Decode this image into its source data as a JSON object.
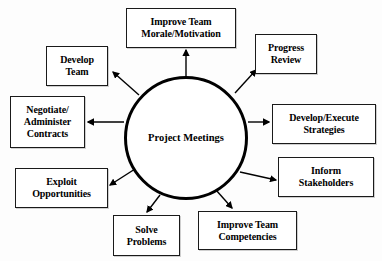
{
  "diagram": {
    "title": "Project Meetings",
    "type": "hub-and-spoke",
    "hub": {
      "label": "Project Meetings",
      "line1": "Project",
      "line2": "Meetings",
      "center_x": 186,
      "center_y": 138,
      "radius": 62,
      "border_color": "#000000",
      "fill_color": "#ffffff"
    },
    "colors": {
      "background": "#fdfdfd",
      "box_border": "#1a1a1a",
      "box_fill": "#ffffff",
      "text": "#000000",
      "arrow": "#000000"
    },
    "nodes": [
      {
        "id": "improve-team-morale-motivation",
        "label": "Improve Team Morale/Motivation",
        "line1": "Improve Team",
        "line2": "Morale/Motivation",
        "x": 126,
        "y": 8,
        "w": 110,
        "h": 40,
        "arrow_direction": "up"
      },
      {
        "id": "progress-review",
        "label": "Progress Review",
        "line1": "Progress",
        "line2": "Review",
        "x": 255,
        "y": 34,
        "w": 62,
        "h": 40,
        "arrow_direction": "up-right"
      },
      {
        "id": "develop-team",
        "label": "Develop Team",
        "line1": "Develop",
        "line2": "Team",
        "x": 46,
        "y": 46,
        "w": 62,
        "h": 40,
        "arrow_direction": "up-left"
      },
      {
        "id": "negotiate-administer-contracts",
        "label": "Negotiate/ Administer Contracts",
        "line1": "Negotiate/",
        "line2": "Administer",
        "line3": "Contracts",
        "x": 10,
        "y": 96,
        "w": 75,
        "h": 52,
        "arrow_direction": "left"
      },
      {
        "id": "develop-execute-strategies",
        "label": "Develop/Execute Strategies",
        "line1": "Develop/Execute",
        "line2": "Strategies",
        "x": 272,
        "y": 104,
        "w": 104,
        "h": 40,
        "arrow_direction": "right"
      },
      {
        "id": "inform-stakeholders",
        "label": "Inform Stakeholders",
        "line1": "Inform",
        "line2": "Stakeholders",
        "x": 278,
        "y": 157,
        "w": 96,
        "h": 40,
        "arrow_direction": "down-right"
      },
      {
        "id": "exploit-opportunities",
        "label": "Exploit Opportunities",
        "line1": "Exploit",
        "line2": "Opportunities",
        "x": 15,
        "y": 168,
        "w": 93,
        "h": 40,
        "arrow_direction": "down-left"
      },
      {
        "id": "solve-problems",
        "label": "Solve Problems",
        "line1": "Solve",
        "line2": "Problems",
        "x": 113,
        "y": 215,
        "w": 67,
        "h": 41,
        "arrow_direction": "down-left"
      },
      {
        "id": "improve-team-competencies",
        "label": "Improve Team Competencies",
        "line1": "Improve Team",
        "line2": "Competencies",
        "x": 198,
        "y": 211,
        "w": 99,
        "h": 39,
        "arrow_direction": "down-right"
      }
    ],
    "arrows": [
      {
        "id": "arrow-to-improve-team-morale",
        "x1": 186,
        "y1": 76,
        "x2": 186,
        "y2": 50
      },
      {
        "id": "arrow-to-progress-review",
        "x1": 235,
        "y1": 93,
        "x2": 256,
        "y2": 70
      },
      {
        "id": "arrow-to-develop-team",
        "x1": 139,
        "y1": 95,
        "x2": 113,
        "y2": 72
      },
      {
        "id": "arrow-to-negotiate-contracts",
        "x1": 124,
        "y1": 122,
        "x2": 88,
        "y2": 122
      },
      {
        "id": "arrow-to-develop-execute-strategies",
        "x1": 248,
        "y1": 122,
        "x2": 269,
        "y2": 122
      },
      {
        "id": "arrow-to-inform-stakeholders",
        "x1": 240,
        "y1": 172,
        "x2": 276,
        "y2": 180
      },
      {
        "id": "arrow-to-exploit-opportunities",
        "x1": 135,
        "y1": 169,
        "x2": 110,
        "y2": 185
      },
      {
        "id": "arrow-to-solve-problems",
        "x1": 160,
        "y1": 195,
        "x2": 147,
        "y2": 212
      },
      {
        "id": "arrow-to-improve-team-competencies",
        "x1": 216,
        "y1": 190,
        "x2": 232,
        "y2": 208
      }
    ]
  }
}
